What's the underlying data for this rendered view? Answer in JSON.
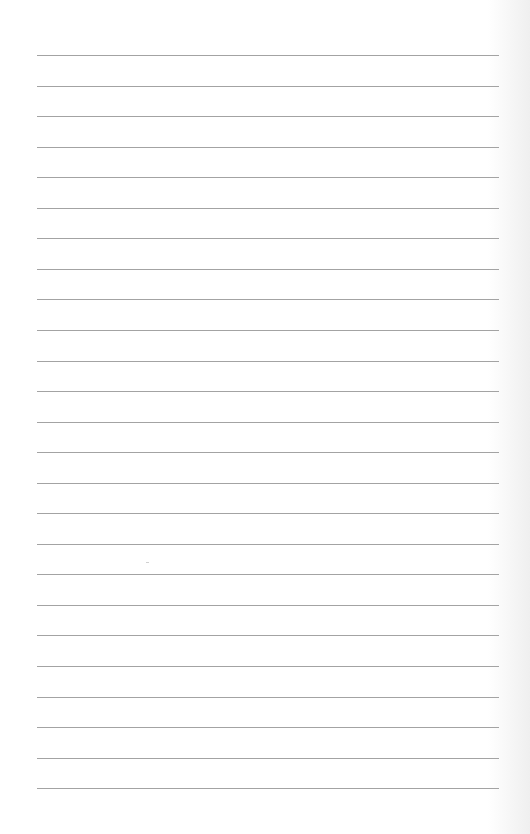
{
  "document": {
    "type": "lined-paper",
    "line_count": 25,
    "first_line_y": 55,
    "line_spacing": 30.55,
    "line_left": 37,
    "line_width": 462,
    "line_color": "#a3a3a3",
    "background": "#ffffff",
    "text": ""
  }
}
